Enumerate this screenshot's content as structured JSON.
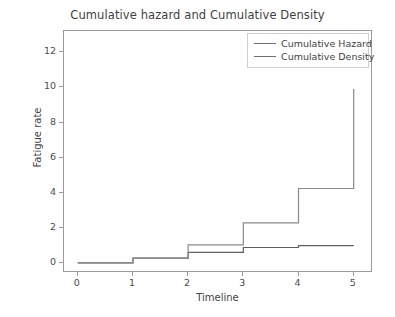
{
  "chart_data": {
    "type": "line",
    "title": "Cumulative hazard and Cumulative Density",
    "xlabel": "Timeline",
    "ylabel": "Fatigue rate",
    "xlim": [
      -0.25,
      5.35
    ],
    "ylim": [
      -0.55,
      13.2
    ],
    "xticks": [
      0,
      1,
      2,
      3,
      4,
      5
    ],
    "xticklabels": [
      "0",
      "1",
      "2",
      "3",
      "4",
      "5"
    ],
    "yticks": [
      0,
      2,
      4,
      6,
      8,
      10,
      12
    ],
    "yticklabels": [
      "0",
      "2",
      "4",
      "6",
      "8",
      "10",
      "12"
    ],
    "grid": false,
    "drawstyle": "steps-post",
    "legend_position": "upper right",
    "series": [
      {
        "name": "Cumulative Hazard",
        "color": "#5f5f5f",
        "x": [
          0,
          1,
          2,
          3,
          4,
          5
        ],
        "values": [
          0.03,
          0.3,
          0.62,
          0.9,
          1.0,
          1.0
        ]
      },
      {
        "name": "Cumulative Density",
        "color": "#8a8a8a",
        "x": [
          0,
          1,
          2,
          3,
          4,
          5
        ],
        "values": [
          0.03,
          0.3,
          1.05,
          2.3,
          4.25,
          9.9
        ]
      }
    ]
  },
  "legend": {
    "items": [
      {
        "label": "Cumulative Hazard"
      },
      {
        "label": "Cumulative Density"
      }
    ]
  }
}
